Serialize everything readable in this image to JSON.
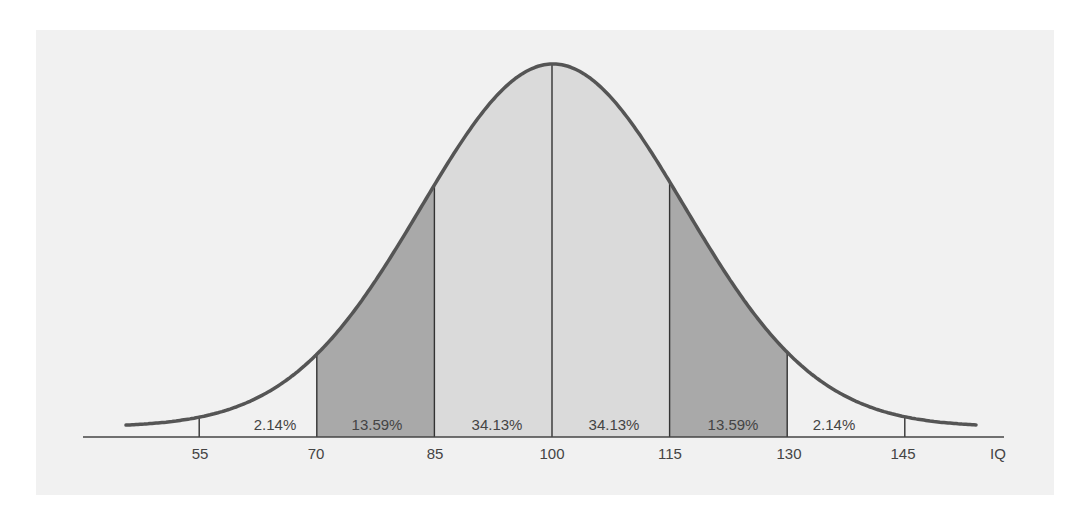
{
  "chart_data": {
    "type": "area",
    "title": "",
    "xlabel": "IQ",
    "ylabel": "",
    "distribution": "normal",
    "mean": 100,
    "sd": 15,
    "x_ticks": [
      55,
      70,
      85,
      100,
      115,
      130,
      145
    ],
    "xlim": [
      45,
      155
    ],
    "grid": false,
    "legend": "none",
    "segments": [
      {
        "from": 55,
        "to": 70,
        "label": "2.14%",
        "value": 2.14,
        "fill": "none"
      },
      {
        "from": 70,
        "to": 85,
        "label": "13.59%",
        "value": 13.59,
        "fill": "dark"
      },
      {
        "from": 85,
        "to": 100,
        "label": "34.13%",
        "value": 34.13,
        "fill": "light"
      },
      {
        "from": 100,
        "to": 115,
        "label": "34.13%",
        "value": 34.13,
        "fill": "light"
      },
      {
        "from": 115,
        "to": 130,
        "label": "13.59%",
        "value": 13.59,
        "fill": "dark"
      },
      {
        "from": 130,
        "to": 145,
        "label": "2.14%",
        "value": 2.14,
        "fill": "none"
      }
    ],
    "colors": {
      "panel": "#f1f1f1",
      "light_fill": "#dadada",
      "dark_fill": "#a9a9a9",
      "curve": "#555555",
      "axis": "#444444",
      "text": "#444444"
    }
  },
  "labels": {
    "pct": [
      "2.14%",
      "13.59%",
      "34.13%",
      "34.13%",
      "13.59%",
      "2.14%"
    ],
    "ticks": [
      "55",
      "70",
      "85",
      "100",
      "115",
      "130",
      "145"
    ],
    "axis_title": "IQ"
  }
}
